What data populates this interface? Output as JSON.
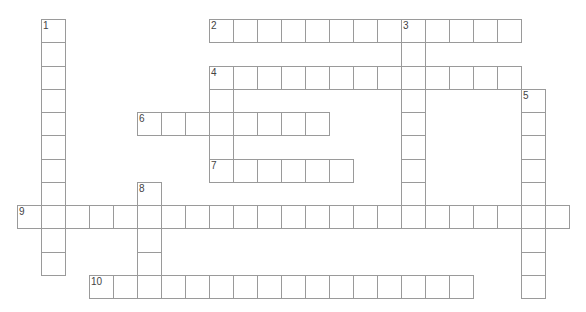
{
  "puzzle": {
    "type": "crossword",
    "cell_width": 24,
    "row_height": 23.25,
    "origin_x": 17,
    "origin_y": 19,
    "colors": {
      "border": "#9a9a9a",
      "number": "#444444",
      "background": "#ffffff"
    },
    "words": [
      {
        "number": "1",
        "direction": "down",
        "row": 0,
        "col": 1,
        "length": 11
      },
      {
        "number": "2",
        "direction": "across",
        "row": 0,
        "col": 8,
        "length": 13
      },
      {
        "number": "3",
        "direction": "down",
        "row": 0,
        "col": 16,
        "length": 9
      },
      {
        "number": "4",
        "direction": "across",
        "row": 2,
        "col": 8,
        "length": 13
      },
      {
        "number": "",
        "direction": "down",
        "row": 2,
        "col": 8,
        "length": 5
      },
      {
        "number": "5",
        "direction": "down",
        "row": 3,
        "col": 21,
        "length": 9
      },
      {
        "number": "6",
        "direction": "across",
        "row": 4,
        "col": 5,
        "length": 8
      },
      {
        "number": "7",
        "direction": "across",
        "row": 6,
        "col": 8,
        "length": 6
      },
      {
        "number": "8",
        "direction": "down",
        "row": 7,
        "col": 5,
        "length": 5
      },
      {
        "number": "9",
        "direction": "across",
        "row": 8,
        "col": 0,
        "length": 23
      },
      {
        "number": "10",
        "direction": "across",
        "row": 11,
        "col": 3,
        "length": 16
      }
    ]
  }
}
